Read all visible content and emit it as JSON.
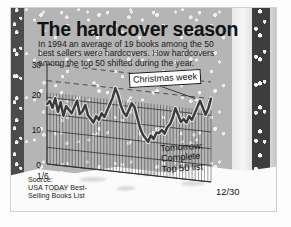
{
  "graphic": {
    "title": "The hardcover season",
    "subtitle_lines": [
      "In 1994 an average of 19 books among the 50",
      "best sellers were hardcovers. How hardcovers",
      "among the top 50 shifted during the year."
    ],
    "source_lines": [
      "Source:",
      "USA TODAY Best-",
      "Selling Books List"
    ],
    "callout": "Christmas week",
    "promo_lines": [
      "Tomorrow:",
      "Complete",
      "Top 50 list"
    ],
    "colors": {
      "line": "#3a3a3a",
      "grid": "#2b2b2b",
      "background": "#b5b5b5",
      "callout_fill": "#ffffff",
      "text": "#121212"
    }
  },
  "chart_data": {
    "type": "line",
    "title": "The hardcover season",
    "subtitle": "In 1994 an average of 19 books among the 50 best sellers were hardcovers. How hardcovers among the top 50 shifted during the year.",
    "xlabel": "",
    "ylabel": "",
    "ylim": [
      0,
      30
    ],
    "yticks": [
      0,
      10,
      20,
      30
    ],
    "ytick_labels": [
      "0",
      "10",
      "20",
      "30"
    ],
    "xtick_labels": [
      "1/6",
      "12/30"
    ],
    "x_start": "1/6",
    "x_end": "12/30",
    "grid": true,
    "legend": false,
    "annotations": [
      {
        "text": "Christmas week",
        "points_to": "late-December peak"
      },
      {
        "text": "Tomorrow: Complete Top 50 list",
        "points_to": "lower right"
      }
    ],
    "average": 19,
    "series": [
      {
        "name": "Hardcovers among top 50",
        "values": [
          18,
          19,
          17,
          20,
          16,
          19,
          15,
          18,
          17,
          16,
          18,
          20,
          16,
          17,
          19,
          16,
          15,
          14,
          16,
          15,
          17,
          16,
          18,
          20,
          22,
          25,
          23,
          20,
          18,
          17,
          19,
          21,
          20,
          17,
          14,
          12,
          11,
          10,
          12,
          11,
          13,
          13,
          14,
          13,
          15,
          16,
          18,
          21,
          19,
          17,
          18,
          17,
          19,
          18,
          20,
          22,
          24,
          22,
          20,
          22,
          25
        ]
      }
    ]
  }
}
